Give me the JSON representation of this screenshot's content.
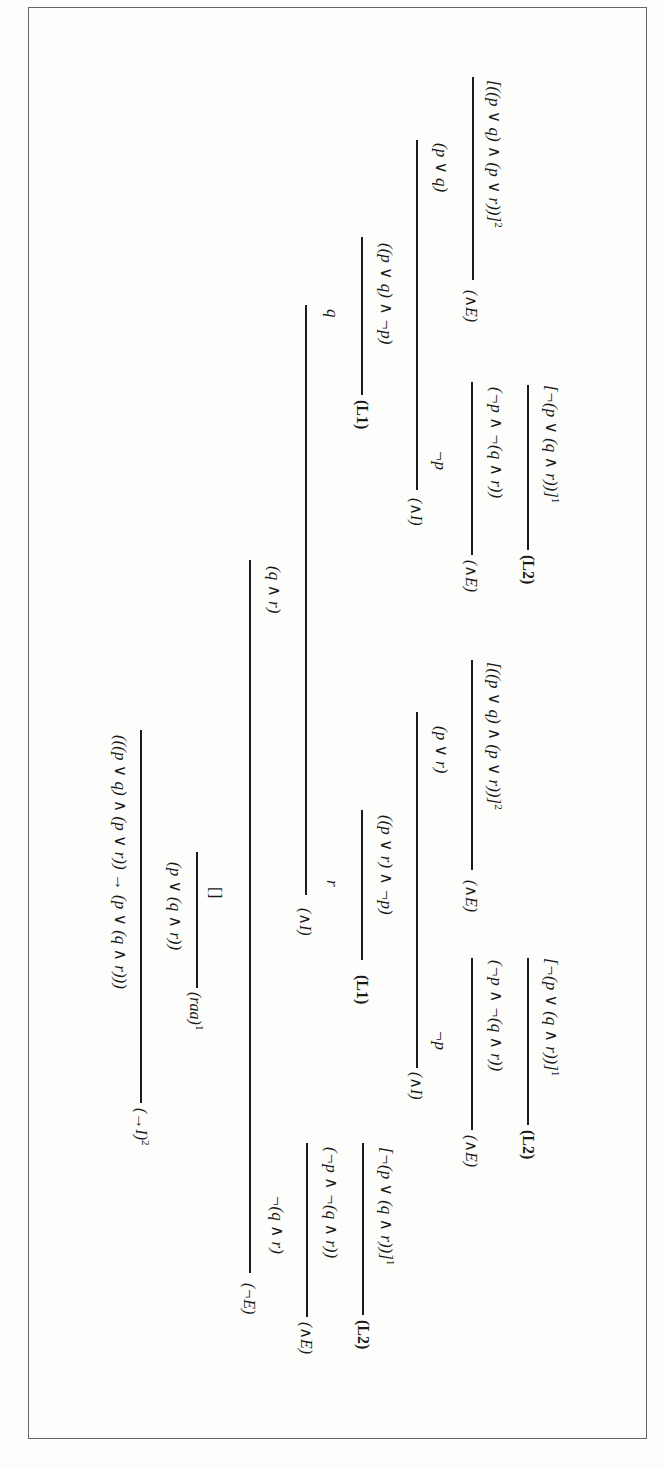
{
  "figure": {
    "orientation": "rotated 90 degrees clockwise",
    "type": "natural deduction proof tree",
    "conclusion": "(((p ∨ q) ∧ (p ∨ r)) → (p ∨ (q ∧ r)))",
    "conclusion_rule": "(→I)",
    "conclusion_rule_index": "2",
    "raa_conclusion": "(p ∨ (q ∧ r))",
    "falsum": "[]",
    "raa_rule": "(raa)",
    "raa_index": "1",
    "neg_elim_rule": "(¬E)",
    "branch_q_and_r": {
      "conclusion": "(q ∧ r)",
      "rule": "(∧I)",
      "left": {
        "conclusion": "q",
        "rule": "(L1)",
        "premise": "((p ∨ q) ∧ ¬p)",
        "intro_rule": "(∧I)",
        "left_conclusion": "(p ∨ q)",
        "left_rule": "(∧E)",
        "left_hypothesis": "[((p ∨ q) ∧ (p ∨ r))]",
        "left_hypothesis_index": "2",
        "right_conclusion": "¬p",
        "right_rule": "(∧E)",
        "right_premise": "(¬p ∧ ¬(q ∧ r))",
        "right_premise_rule": "(L2)",
        "right_hypothesis": "[¬(p ∨ (q ∧ r))]",
        "right_hypothesis_index": "1"
      },
      "right": {
        "conclusion": "r",
        "rule": "(L1)",
        "premise": "((p ∨ r) ∧ ¬p)",
        "intro_rule": "(∧I)",
        "left_conclusion": "(p ∨ r)",
        "left_rule": "(∧E)",
        "left_hypothesis": "[((p ∨ q) ∧ (p ∨ r))]",
        "left_hypothesis_index": "2",
        "right_conclusion": "¬p",
        "right_rule": "(∧E)",
        "right_premise": "(¬p ∧ ¬(q ∧ r))",
        "right_premise_rule": "(L2)",
        "right_hypothesis": "[¬(p ∨ (q ∧ r))]",
        "right_hypothesis_index": "1"
      }
    },
    "branch_not_q_and_r": {
      "conclusion": "¬(q ∧ r)",
      "rule": "(∧E)",
      "premise": "(¬p ∧ ¬(q ∧ r))",
      "premise_rule": "(L2)",
      "hypothesis": "[¬(p ∨ (q ∧ r))]",
      "hypothesis_index": "1"
    }
  }
}
